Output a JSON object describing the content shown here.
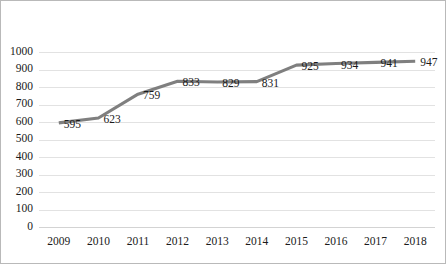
{
  "chart_data": {
    "type": "line",
    "title": "",
    "subtitle": "",
    "xlabel": "",
    "ylabel": "",
    "categories": [
      "2009",
      "2010",
      "2011",
      "2012",
      "2013",
      "2014",
      "2015",
      "2016",
      "2017",
      "2018"
    ],
    "values": [
      595,
      623,
      759,
      833,
      829,
      831,
      925,
      934,
      941,
      947
    ],
    "data_labels": [
      "595",
      "623",
      "759",
      "833",
      "829",
      "831",
      "925",
      "934",
      "941",
      "947"
    ],
    "ylim": [
      0,
      1000
    ],
    "ytick_labels": [
      "1000",
      "900",
      "800",
      "700",
      "600",
      "500",
      "400",
      "300",
      "200",
      "100",
      "0"
    ],
    "ytick_values": [
      1000,
      900,
      800,
      700,
      600,
      500,
      400,
      300,
      200,
      100,
      0
    ],
    "grid": true,
    "grid_axis": "y",
    "legend": false,
    "legend_position": "none",
    "series_color": "#7f7f7f",
    "gridline_color": "#e2e2e2",
    "border_color": "#b9b9b9",
    "background_color": "#ffffff",
    "text_color": "#1a1a1a",
    "show_markers": false,
    "labels_shown": true
  }
}
